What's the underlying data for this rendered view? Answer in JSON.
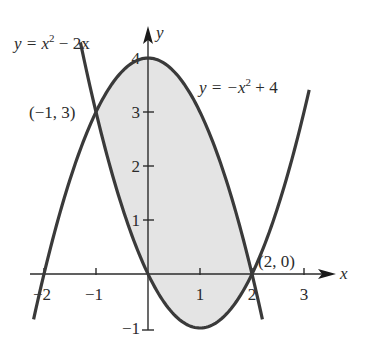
{
  "figure": {
    "type": "graph-of-two-parabolas-with-shaded-region",
    "axes": {
      "x_label": "x",
      "y_label": "y",
      "x_ticks": [
        {
          "value": -2,
          "label": "−2"
        },
        {
          "value": -1,
          "label": "−1"
        },
        {
          "value": 1,
          "label": "1"
        },
        {
          "value": 2,
          "label": "2"
        },
        {
          "value": 3,
          "label": "3"
        }
      ],
      "y_ticks": [
        {
          "value": -1,
          "label": "−1"
        },
        {
          "value": 1,
          "label": "1"
        },
        {
          "value": 2,
          "label": "2"
        },
        {
          "value": 3,
          "label": "3"
        },
        {
          "value": 4,
          "label": "4"
        }
      ]
    },
    "curves": [
      {
        "id": "upward-parabola",
        "label_prefix": "y = x",
        "label_exp": "2",
        "label_suffix": " − 2x",
        "equation": "y = x^2 - 2x",
        "x_range": [
          -1.3,
          3.1
        ]
      },
      {
        "id": "downward-parabola",
        "label_prefix": "y = −x",
        "label_exp": "2",
        "label_suffix": " + 4",
        "equation": "y = -x^2 + 4",
        "x_range": [
          -2.2,
          2.2
        ]
      }
    ],
    "intersection_points": [
      {
        "x": -1,
        "y": 3,
        "label": "(−1, 3)"
      },
      {
        "x": 2,
        "y": 0,
        "label": "(2, 0)"
      }
    ],
    "shaded_region": {
      "between": [
        "y = -x^2 + 4",
        "y = x^2 - 2x"
      ],
      "x_from": -1,
      "x_to": 2,
      "fill": "#e4e4e4"
    },
    "colors": {
      "curve": "#3a3a3a",
      "axis": "#2b2b2b",
      "shade": "#e4e4e4"
    }
  }
}
